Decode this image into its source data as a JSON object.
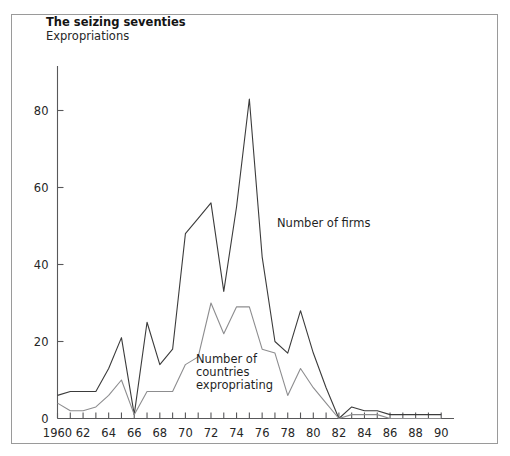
{
  "chart": {
    "title": "The seizing seventies",
    "subtitle": "Expropriations"
  },
  "annotations": {
    "firms_label": "Number of firms",
    "countries_label_line1": "Number of",
    "countries_label_line2": "countries",
    "countries_label_line3": "expropriating"
  },
  "colors": {
    "firms_line": "#3b3b3b",
    "countries_line": "#8d8d8f",
    "axis": "#58585a",
    "frame": "#9a9a9a",
    "background": "#ffffff"
  },
  "chart_data": {
    "type": "line",
    "title": "The seizing seventies",
    "subtitle": "Expropriations",
    "xlabel": "",
    "ylabel": "",
    "xlim": [
      1960,
      1991
    ],
    "ylim": [
      0,
      90
    ],
    "yticks": [
      0,
      20,
      40,
      60,
      80
    ],
    "ytick_labels": [
      "0",
      "20",
      "40",
      "60",
      "80"
    ],
    "xticks": [
      1960,
      1961,
      1962,
      1963,
      1964,
      1965,
      1966,
      1967,
      1968,
      1969,
      1970,
      1971,
      1972,
      1973,
      1974,
      1975,
      1976,
      1977,
      1978,
      1979,
      1980,
      1981,
      1982,
      1983,
      1984,
      1985,
      1986,
      1987,
      1988,
      1989,
      1990
    ],
    "xtick_labels_shown": [
      "1960",
      "62",
      "64",
      "66",
      "68",
      "70",
      "72",
      "74",
      "76",
      "78",
      "80",
      "82",
      "84",
      "86",
      "88",
      "90"
    ],
    "xtick_label_years": [
      1960,
      1962,
      1964,
      1966,
      1968,
      1970,
      1972,
      1974,
      1976,
      1978,
      1980,
      1982,
      1984,
      1986,
      1988,
      1990
    ],
    "grid": false,
    "legend_position": "inline-annotations",
    "x": [
      1960,
      1961,
      1962,
      1963,
      1964,
      1965,
      1966,
      1967,
      1968,
      1969,
      1970,
      1971,
      1972,
      1973,
      1974,
      1975,
      1976,
      1977,
      1978,
      1979,
      1980,
      1981,
      1982,
      1983,
      1984,
      1985,
      1986,
      1987,
      1988,
      1989,
      1990
    ],
    "series": [
      {
        "name": "Number of firms",
        "color": "#3b3b3b",
        "values": [
          6,
          7,
          7,
          7,
          13,
          21,
          1,
          25,
          14,
          18,
          48,
          52,
          56,
          33,
          55,
          83,
          42,
          20,
          17,
          28,
          17,
          8,
          0,
          3,
          2,
          2,
          1,
          1,
          1,
          1,
          1
        ]
      },
      {
        "name": "Number of countries expropriating",
        "color": "#8d8d8f",
        "values": [
          4,
          2,
          2,
          3,
          6,
          10,
          1,
          7,
          7,
          7,
          14,
          16,
          30,
          22,
          29,
          29,
          18,
          17,
          6,
          13,
          8,
          4,
          0,
          1,
          1,
          1,
          0,
          0,
          0,
          0,
          0
        ]
      }
    ]
  }
}
